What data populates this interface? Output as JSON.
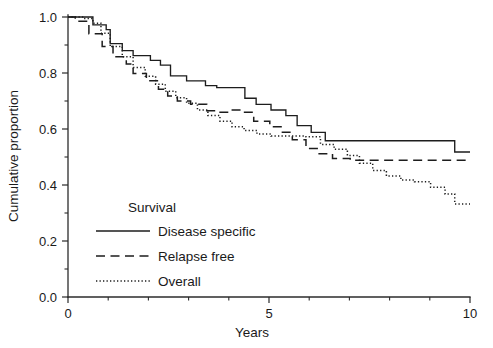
{
  "chart_data": {
    "type": "line",
    "title": "",
    "xlabel": "Years",
    "ylabel": "Cumulative proportion",
    "xlim": [
      0,
      10
    ],
    "ylim": [
      0.0,
      1.0
    ],
    "grid": false,
    "x_ticks_major": [
      0,
      5,
      10
    ],
    "x_tick_labels": [
      "0",
      "5",
      "10"
    ],
    "x_ticks_minor": [
      1,
      2,
      3,
      4,
      6,
      7,
      8,
      9
    ],
    "y_ticks_major": [
      0.0,
      0.2,
      0.4,
      0.6,
      0.8,
      1.0
    ],
    "y_tick_labels": [
      "0.0",
      "0.2",
      "0.4",
      "0.6",
      "0.8",
      "1.0"
    ],
    "y_ticks_minor": [
      0.1,
      0.3,
      0.5,
      0.7,
      0.9
    ],
    "legend_position": "center-left-inside",
    "legend_title": "Survival",
    "series": [
      {
        "name": "Disease specific",
        "style": "solid",
        "points": [
          [
            0.0,
            1.0
          ],
          [
            0.45,
            1.0
          ],
          [
            0.62,
            0.972
          ],
          [
            0.95,
            0.955
          ],
          [
            1.05,
            0.905
          ],
          [
            1.35,
            0.88
          ],
          [
            1.62,
            0.862
          ],
          [
            2.05,
            0.845
          ],
          [
            2.3,
            0.828
          ],
          [
            2.55,
            0.79
          ],
          [
            2.95,
            0.772
          ],
          [
            3.42,
            0.755
          ],
          [
            3.7,
            0.748
          ],
          [
            4.12,
            0.748
          ],
          [
            4.4,
            0.71
          ],
          [
            4.68,
            0.688
          ],
          [
            5.05,
            0.668
          ],
          [
            5.42,
            0.648
          ],
          [
            5.7,
            0.612
          ],
          [
            6.05,
            0.588
          ],
          [
            6.4,
            0.558
          ],
          [
            9.35,
            0.558
          ],
          [
            9.62,
            0.518
          ],
          [
            10.0,
            0.518
          ]
        ]
      },
      {
        "name": "Relapse free",
        "style": "dashed",
        "points": [
          [
            0.0,
            1.0
          ],
          [
            0.18,
            0.985
          ],
          [
            0.52,
            0.94
          ],
          [
            0.85,
            0.895
          ],
          [
            1.12,
            0.858
          ],
          [
            1.45,
            0.832
          ],
          [
            1.62,
            0.798
          ],
          [
            1.95,
            0.772
          ],
          [
            2.25,
            0.742
          ],
          [
            2.48,
            0.718
          ],
          [
            2.72,
            0.7
          ],
          [
            3.05,
            0.688
          ],
          [
            3.45,
            0.665
          ],
          [
            3.72,
            0.66
          ],
          [
            4.02,
            0.668
          ],
          [
            4.35,
            0.66
          ],
          [
            4.62,
            0.628
          ],
          [
            5.02,
            0.608
          ],
          [
            5.3,
            0.588
          ],
          [
            5.58,
            0.562
          ],
          [
            5.92,
            0.53
          ],
          [
            6.22,
            0.512
          ],
          [
            6.58,
            0.495
          ],
          [
            7.02,
            0.488
          ],
          [
            10.0,
            0.488
          ]
        ]
      },
      {
        "name": "Overall",
        "style": "dotted",
        "points": [
          [
            0.0,
            1.0
          ],
          [
            0.4,
            0.995
          ],
          [
            0.62,
            0.978
          ],
          [
            0.82,
            0.942
          ],
          [
            1.05,
            0.895
          ],
          [
            1.35,
            0.858
          ],
          [
            1.62,
            0.82
          ],
          [
            1.92,
            0.788
          ],
          [
            2.18,
            0.76
          ],
          [
            2.42,
            0.735
          ],
          [
            2.68,
            0.712
          ],
          [
            2.95,
            0.692
          ],
          [
            3.22,
            0.668
          ],
          [
            3.48,
            0.648
          ],
          [
            3.78,
            0.628
          ],
          [
            4.08,
            0.608
          ],
          [
            4.38,
            0.595
          ],
          [
            4.7,
            0.582
          ],
          [
            5.05,
            0.575
          ],
          [
            5.92,
            0.572
          ],
          [
            6.28,
            0.545
          ],
          [
            6.62,
            0.528
          ],
          [
            6.95,
            0.505
          ],
          [
            7.25,
            0.478
          ],
          [
            7.58,
            0.452
          ],
          [
            7.92,
            0.432
          ],
          [
            8.28,
            0.418
          ],
          [
            8.62,
            0.412
          ],
          [
            9.02,
            0.392
          ],
          [
            9.38,
            0.368
          ],
          [
            9.62,
            0.332
          ],
          [
            10.0,
            0.332
          ]
        ]
      }
    ]
  },
  "legend": {
    "title": "Survival",
    "items": [
      {
        "label": "Disease specific",
        "style": "solid"
      },
      {
        "label": "Relapse free",
        "style": "dashed"
      },
      {
        "label": "Overall",
        "style": "dotted"
      }
    ]
  },
  "axes": {
    "x_title": "Years",
    "y_title": "Cumulative proportion"
  },
  "colors": {
    "line": "#1d1d1d",
    "axis": "#2b2b2b",
    "text": "#1a1a1a",
    "background": "#ffffff"
  }
}
